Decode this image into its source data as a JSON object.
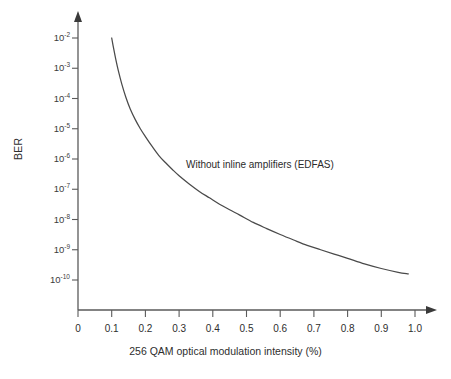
{
  "chart_data": {
    "type": "line",
    "title": "",
    "subtitle": "",
    "xlabel": "256 QAM optical modulation intensity (%)",
    "ylabel": "BER",
    "yscale": "log",
    "xscale": "linear",
    "xlim": [
      0,
      1.0
    ],
    "ylim": [
      1e-10,
      0.01
    ],
    "grid": false,
    "legend": null,
    "legend_position": "none",
    "annotations": [
      {
        "text": "Without inline amplifiers (EDFAS)",
        "x": 0.41,
        "y": 3.2e-07
      }
    ],
    "xticks": [
      0,
      0.1,
      0.2,
      0.3,
      0.4,
      0.5,
      0.6,
      0.7,
      0.8,
      0.9,
      1.0
    ],
    "xticklabels": [
      "0",
      "0.1",
      "0.2",
      "0.3",
      "0.4",
      "0.5",
      "0.6",
      "0.7",
      "0.8",
      "0.9",
      "1.0"
    ],
    "yticks": [
      0.01,
      0.001,
      0.0001,
      1e-05,
      1e-06,
      1e-07,
      1e-08,
      1e-09,
      1e-10
    ],
    "ytickbases": [
      "10",
      "10",
      "10",
      "10",
      "10",
      "10",
      "10",
      "10",
      "10"
    ],
    "ytickexponents": [
      "-2",
      "-3",
      "-4",
      "-5",
      "-6",
      "-7",
      "-8",
      "-9",
      "-10"
    ],
    "series": [
      {
        "name": "Without inline amplifiers (EDFAS)",
        "x": [
          0.1,
          0.105,
          0.112,
          0.12,
          0.13,
          0.142,
          0.155,
          0.17,
          0.185,
          0.2,
          0.22,
          0.24,
          0.26,
          0.28,
          0.3,
          0.33,
          0.36,
          0.39,
          0.42,
          0.45,
          0.48,
          0.52,
          0.56,
          0.6,
          0.64,
          0.68,
          0.72,
          0.76,
          0.8,
          0.85,
          0.9,
          0.95,
          0.98
        ],
        "y": [
          0.01,
          0.005,
          0.002,
          0.0008,
          0.0003,
          0.00011,
          4.5e-05,
          2e-05,
          1e-05,
          5.5e-06,
          2.6e-06,
          1.3e-06,
          7.5e-07,
          4.5e-07,
          2.8e-07,
          1.5e-07,
          8.5e-08,
          5.2e-08,
          3.2e-08,
          2.1e-08,
          1.4e-08,
          8e-09,
          5e-09,
          3.2e-09,
          2.1e-09,
          1.4e-09,
          1e-09,
          7.2e-10,
          5.2e-10,
          3.4e-10,
          2.4e-10,
          1.8e-10,
          1.6e-10
        ]
      }
    ]
  },
  "axes": {
    "y_title": "BER",
    "x_title": "256 QAM optical modulation intensity (%)"
  },
  "annotation": {
    "label": "Without inline amplifiers (EDFAS)"
  },
  "colors": {
    "curve": "#4a4a4a",
    "axis": "#5a5a5a",
    "text": "#2e2e2e",
    "background": "#ffffff"
  }
}
